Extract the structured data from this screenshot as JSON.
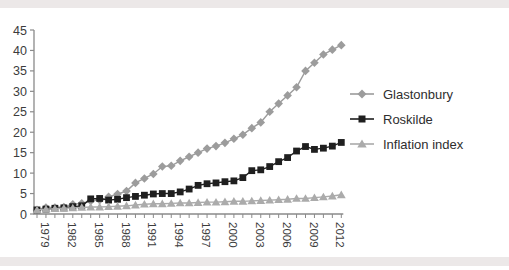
{
  "page": {
    "background_color": "#ffffff",
    "edge_band_color": "#ece8e8",
    "axis_color": "#8a8a8a",
    "tick_label_color": "#3c3c3c"
  },
  "chart_data": {
    "type": "line",
    "title": "",
    "xlabel": "",
    "ylabel": "",
    "x": [
      1979,
      1980,
      1981,
      1982,
      1983,
      1984,
      1985,
      1986,
      1987,
      1988,
      1989,
      1990,
      1991,
      1992,
      1993,
      1994,
      1995,
      1996,
      1997,
      1998,
      1999,
      2000,
      2001,
      2002,
      2003,
      2004,
      2005,
      2006,
      2007,
      2008,
      2009,
      2010,
      2011,
      2012,
      2013
    ],
    "series": [
      {
        "name": "Glastonbury",
        "marker": "diamond",
        "color": "#9c9c9c",
        "values": [
          1.0,
          1.6,
          1.6,
          1.7,
          2.4,
          2.6,
          3.2,
          3.4,
          4.2,
          4.9,
          5.6,
          7.6,
          8.7,
          9.8,
          11.6,
          11.8,
          13.0,
          14.0,
          15.0,
          16.0,
          16.6,
          17.4,
          18.4,
          19.4,
          21.0,
          22.4,
          25.0,
          27.0,
          29.0,
          31.0,
          35.0,
          37.0,
          39.0,
          40.2,
          41.3
        ]
      },
      {
        "name": "Roskilde",
        "marker": "square",
        "color": "#1f1f1f",
        "values": [
          1.0,
          1.2,
          1.4,
          1.5,
          1.8,
          2.0,
          3.7,
          3.8,
          3.4,
          3.6,
          4.0,
          4.3,
          4.6,
          4.9,
          5.0,
          5.0,
          5.4,
          6.1,
          7.0,
          7.4,
          7.6,
          7.9,
          8.1,
          8.9,
          10.6,
          10.8,
          11.6,
          12.8,
          13.8,
          15.4,
          16.5,
          15.8,
          16.1,
          16.6,
          17.5
        ]
      },
      {
        "name": "Inflation index",
        "marker": "triangle",
        "color": "#ababab",
        "values": [
          1.0,
          1.2,
          1.3,
          1.4,
          1.5,
          1.6,
          1.7,
          1.7,
          1.8,
          1.9,
          2.0,
          2.2,
          2.4,
          2.5,
          2.5,
          2.6,
          2.7,
          2.7,
          2.8,
          2.9,
          2.9,
          3.0,
          3.1,
          3.1,
          3.2,
          3.3,
          3.4,
          3.5,
          3.6,
          3.8,
          3.8,
          4.0,
          4.2,
          4.4,
          4.7
        ]
      }
    ],
    "ylim": [
      0,
      45
    ],
    "yticks": [
      0,
      5,
      10,
      15,
      20,
      25,
      30,
      35,
      40,
      45
    ],
    "xtick_every_year": true,
    "xtick_labeled_years": [
      1979,
      1982,
      1985,
      1988,
      1991,
      1994,
      1997,
      2000,
      2003,
      2006,
      2009,
      2012
    ],
    "xtick_label_rotation_deg": 90,
    "grid": false,
    "legend_position": "right"
  },
  "legend": {
    "items": [
      {
        "label": "Glastonbury"
      },
      {
        "label": "Roskilde"
      },
      {
        "label": "Inflation index"
      }
    ]
  }
}
